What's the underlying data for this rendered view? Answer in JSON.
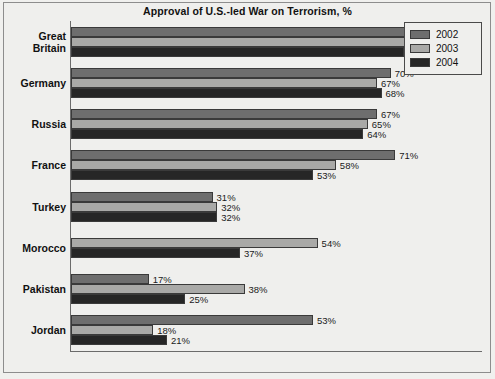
{
  "chart": {
    "title": "Approval of U.S.-led War on Terrorism, %",
    "axis_max_label": "",
    "legend_position": "top-right"
  },
  "legend": {
    "items": [
      {
        "label": "2002",
        "color": "#6e6e6e"
      },
      {
        "label": "2003",
        "color": "#a9a9a7"
      },
      {
        "label": "2004",
        "color": "#262626"
      }
    ]
  },
  "countries": [
    {
      "name_line1": "Great",
      "name_line2": "Britain",
      "bars": [
        {
          "series": "2002",
          "value": 83,
          "label": "83%"
        },
        {
          "series": "2003",
          "value": 80,
          "label": "80%"
        },
        {
          "series": "2004",
          "value": 73,
          "label": "73%"
        }
      ]
    },
    {
      "name_line1": "Germany",
      "name_line2": "",
      "bars": [
        {
          "series": "2002",
          "value": 70,
          "label": "70%"
        },
        {
          "series": "2003",
          "value": 67,
          "label": "67%"
        },
        {
          "series": "2004",
          "value": 68,
          "label": "68%"
        }
      ]
    },
    {
      "name_line1": "Russia",
      "name_line2": "",
      "bars": [
        {
          "series": "2002",
          "value": 67,
          "label": "67%"
        },
        {
          "series": "2003",
          "value": 65,
          "label": "65%"
        },
        {
          "series": "2004",
          "value": 64,
          "label": "64%"
        }
      ]
    },
    {
      "name_line1": "France",
      "name_line2": "",
      "bars": [
        {
          "series": "2002",
          "value": 71,
          "label": "71%"
        },
        {
          "series": "2003",
          "value": 58,
          "label": "58%"
        },
        {
          "series": "2004",
          "value": 53,
          "label": "53%"
        }
      ]
    },
    {
      "name_line1": "Turkey",
      "name_line2": "",
      "bars": [
        {
          "series": "2002",
          "value": 31,
          "label": "31%"
        },
        {
          "series": "2003",
          "value": 32,
          "label": "32%"
        },
        {
          "series": "2004",
          "value": 32,
          "label": "32%"
        }
      ]
    },
    {
      "name_line1": "Morocco",
      "name_line2": "",
      "bars": [
        {
          "series": "2003",
          "value": 54,
          "label": "54%"
        },
        {
          "series": "2004",
          "value": 37,
          "label": "37%"
        }
      ]
    },
    {
      "name_line1": "Pakistan",
      "name_line2": "",
      "bars": [
        {
          "series": "2002",
          "value": 17,
          "label": "17%"
        },
        {
          "series": "2003",
          "value": 38,
          "label": "38%"
        },
        {
          "series": "2004",
          "value": 25,
          "label": "25%"
        }
      ]
    },
    {
      "name_line1": "Jordan",
      "name_line2": "",
      "bars": [
        {
          "series": "2002",
          "value": 53,
          "label": "53%"
        },
        {
          "series": "2003",
          "value": 18,
          "label": "18%"
        },
        {
          "series": "2004",
          "value": 21,
          "label": "21%"
        }
      ]
    }
  ],
  "chart_data": {
    "type": "bar",
    "orientation": "horizontal",
    "title": "Approval of U.S.-led War on Terrorism, %",
    "xlabel": "",
    "ylabel": "",
    "xlim": [
      0,
      90
    ],
    "grid": false,
    "legend_position": "top-right",
    "categories": [
      "Great Britain",
      "Germany",
      "Russia",
      "France",
      "Turkey",
      "Morocco",
      "Pakistan",
      "Jordan"
    ],
    "series": [
      {
        "name": "2002",
        "color": "#6e6e6e",
        "values": [
          83,
          70,
          67,
          71,
          31,
          null,
          17,
          53
        ]
      },
      {
        "name": "2003",
        "color": "#a9a9a7",
        "values": [
          80,
          67,
          65,
          58,
          32,
          54,
          38,
          18
        ]
      },
      {
        "name": "2004",
        "color": "#262626",
        "values": [
          73,
          68,
          64,
          53,
          32,
          37,
          25,
          21
        ]
      }
    ],
    "data_labels": {
      "Great Britain": [
        "83%",
        "80%",
        "73%"
      ],
      "Germany": [
        "70%",
        "67%",
        "68%"
      ],
      "Russia": [
        "67%",
        "65%",
        "64%"
      ],
      "France": [
        "71%",
        "58%",
        "53%"
      ],
      "Turkey": [
        "31%",
        "32%",
        "32%"
      ],
      "Morocco": [
        "54%",
        "37%"
      ],
      "Pakistan": [
        "17%",
        "38%",
        "25%"
      ],
      "Jordan": [
        "53%",
        "18%",
        "21%"
      ]
    }
  }
}
